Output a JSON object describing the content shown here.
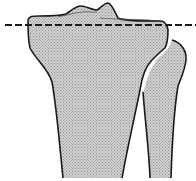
{
  "figure": {
    "structures": [
      {
        "name": "tibia"
      },
      {
        "name": "fibula"
      },
      {
        "name": "tibial-plateau-line",
        "style": "dashed"
      }
    ],
    "colors": {
      "outline": "#1a1a1a",
      "fill": "#c9c9c9",
      "fill_dot": "#9a9a9a",
      "background": "#ffffff"
    }
  }
}
